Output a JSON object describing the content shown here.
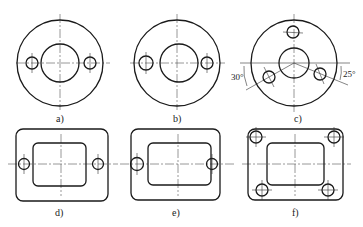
{
  "figure": {
    "panels": [
      {
        "id": "a",
        "label": "a)",
        "shape": "round-flange",
        "holes": 2
      },
      {
        "id": "b",
        "label": "b)",
        "shape": "round-flange",
        "holes": 2
      },
      {
        "id": "c",
        "label": "c)",
        "shape": "round-flange",
        "holes": 3,
        "angles": {
          "left": "30°",
          "right": "25°"
        }
      },
      {
        "id": "d",
        "label": "d)",
        "shape": "rect-flange",
        "holes": 2
      },
      {
        "id": "e",
        "label": "e)",
        "shape": "rect-flange",
        "holes": 2
      },
      {
        "id": "f",
        "label": "f)",
        "shape": "rect-flange",
        "holes": 4
      }
    ]
  },
  "colors": {
    "line": "#1a1a1a",
    "background": "#ffffff"
  }
}
